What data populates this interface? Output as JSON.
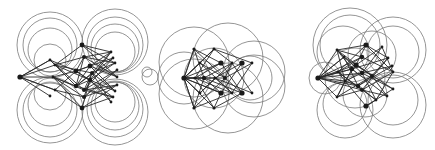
{
  "figure": {
    "width": 435,
    "height": 150,
    "colors": {
      "circle": "#7a7a7a",
      "edge": "#2a2a2a",
      "node": "#1a1a1a",
      "background": "#ffffff"
    },
    "panels": [
      {
        "name": "graph-drawing-left",
        "nodes": [
          [
            20,
            77,
            2.6
          ],
          [
            82,
            45,
            2.4
          ],
          [
            82,
            108,
            2.4
          ],
          [
            84,
            57,
            2
          ],
          [
            84,
            97,
            2
          ],
          [
            90,
            66,
            2.4
          ],
          [
            76,
            71,
            2.4
          ],
          [
            90,
            80,
            2.2
          ],
          [
            76,
            86,
            2.2
          ],
          [
            92,
            73,
            2
          ],
          [
            84,
            90,
            2
          ],
          [
            50,
            60,
            1.4
          ],
          [
            55,
            65,
            1.4
          ],
          [
            53,
            77,
            1.4
          ],
          [
            50,
            96,
            1.4
          ],
          [
            55,
            90,
            1.4
          ],
          [
            111,
            52,
            1.4
          ],
          [
            113,
            58,
            1.4
          ],
          [
            115,
            63,
            1.4
          ],
          [
            117,
            70,
            1.4
          ],
          [
            117,
            77,
            1.4
          ],
          [
            117,
            85,
            1.4
          ],
          [
            115,
            91,
            1.4
          ],
          [
            113,
            97,
            1.4
          ],
          [
            111,
            102,
            1.4
          ]
        ],
        "edges_from_hubs": [
          0
        ],
        "circles": [
          [
            50,
            45,
            33
          ],
          [
            50,
            45,
            27
          ],
          [
            50,
            50,
            22
          ],
          [
            50,
            110,
            33
          ],
          [
            50,
            110,
            27
          ],
          [
            50,
            104,
            22
          ],
          [
            115,
            42,
            33
          ],
          [
            115,
            45,
            28
          ],
          [
            115,
            48,
            24
          ],
          [
            115,
            52,
            20
          ],
          [
            115,
            112,
            33
          ],
          [
            115,
            109,
            28
          ],
          [
            115,
            106,
            24
          ],
          [
            115,
            102,
            20
          ],
          [
            50,
            60,
            16
          ],
          [
            50,
            94,
            16
          ],
          [
            150,
            77,
            8
          ],
          [
            147,
            72,
            5
          ]
        ]
      },
      {
        "name": "graph-drawing-middle",
        "nodes": [
          [
            184,
            78,
            2.6
          ],
          [
            195,
            78,
            1.6
          ],
          [
            204,
            78,
            2.2
          ],
          [
            215,
            78,
            1.6
          ],
          [
            225,
            78,
            2
          ],
          [
            194,
            49,
            1.6
          ],
          [
            214,
            49,
            1.6
          ],
          [
            200,
            63,
            1.4
          ],
          [
            221,
            63,
            2.6
          ],
          [
            232,
            63,
            1.4
          ],
          [
            242,
            63,
            2.6
          ],
          [
            252,
            63,
            1.4
          ],
          [
            200,
            93,
            1.4
          ],
          [
            221,
            93,
            2.6
          ],
          [
            232,
            93,
            1.4
          ],
          [
            242,
            93,
            2.6
          ],
          [
            252,
            93,
            1.4
          ],
          [
            194,
            108,
            1.6
          ],
          [
            214,
            108,
            1.6
          ]
        ],
        "edges_from_hubs": [
          0
        ],
        "circles": [
          [
            194,
            62,
            35
          ],
          [
            228,
            58,
            35
          ],
          [
            254,
            72,
            31
          ],
          [
            194,
            94,
            35
          ],
          [
            228,
            98,
            35
          ],
          [
            254,
            86,
            31
          ],
          [
            184,
            78,
            26
          ],
          [
            214,
            78,
            30
          ],
          [
            250,
            78,
            22
          ]
        ]
      },
      {
        "name": "graph-drawing-right",
        "nodes": [
          [
            318,
            78,
            2.6
          ],
          [
            366,
            45,
            2.6
          ],
          [
            366,
            106,
            2.6
          ],
          [
            362,
            57,
            2.2
          ],
          [
            356,
            65,
            2.6
          ],
          [
            352,
            69,
            2.2
          ],
          [
            362,
            73,
            2.2
          ],
          [
            372,
            76,
            2
          ],
          [
            358,
            86,
            2.2
          ],
          [
            362,
            90,
            2
          ],
          [
            337,
            50,
            1.4
          ],
          [
            344,
            57,
            1.4
          ],
          [
            338,
            72,
            1.4
          ],
          [
            345,
            81,
            1.4
          ],
          [
            337,
            97,
            1.4
          ],
          [
            382,
            47,
            1.4
          ],
          [
            388,
            58,
            1.4
          ],
          [
            392,
            66,
            1.4
          ],
          [
            393,
            72,
            1.4
          ],
          [
            393,
            89,
            1.4
          ],
          [
            387,
            96,
            1.4
          ],
          [
            376,
            100,
            1.4
          ]
        ],
        "edges_from_hubs": [
          0
        ],
        "circles": [
          [
            350,
            45,
            37
          ],
          [
            350,
            45,
            30
          ],
          [
            343,
            52,
            26
          ],
          [
            393,
            50,
            33
          ],
          [
            393,
            52,
            26
          ],
          [
            372,
            55,
            24
          ],
          [
            345,
            110,
            28
          ],
          [
            345,
            104,
            22
          ],
          [
            393,
            105,
            33
          ],
          [
            393,
            100,
            25
          ],
          [
            365,
            95,
            22
          ],
          [
            325,
            78,
            16
          ],
          [
            355,
            78,
            30
          ]
        ]
      }
    ]
  }
}
